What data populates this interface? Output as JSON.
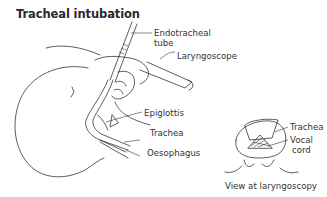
{
  "title": "Tracheal intubation",
  "labels": {
    "endotracheal_tube_line1": "Endotracheal",
    "endotracheal_tube_line2": "tube",
    "laryngoscope": "Laryngoscope",
    "epiglottis": "Epiglottis",
    "trachea": "Trachea",
    "oesophagus": "Oesophagus",
    "inset_trachea": "Trachea",
    "vocal_cord_line1": "Vocal",
    "vocal_cord_line2": "cord",
    "inset_caption": "View at laryngoscopy"
  }
}
